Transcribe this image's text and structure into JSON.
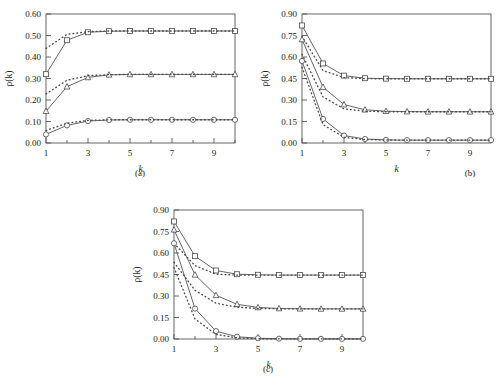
{
  "figure": {
    "panels": [
      {
        "id": "a",
        "caption": "(a)"
      },
      {
        "id": "b",
        "caption": "(b)"
      },
      {
        "id": "c",
        "caption": "(c)"
      }
    ]
  },
  "labels": {
    "xaxis": "k",
    "yaxis": "ρ(k)",
    "caption_a": "(a)",
    "caption_b": "(b)",
    "caption_c": "(c)"
  },
  "chart_data": [
    {
      "type": "line",
      "panel": "(a)",
      "title": "",
      "xlabel": "k",
      "ylabel": "ρ(k)",
      "xlim": [
        1,
        10
      ],
      "ylim": [
        0.0,
        0.6
      ],
      "xticks": [
        1,
        3,
        5,
        7,
        9
      ],
      "xticklabels": [
        "1",
        "3",
        "5",
        "7",
        "9"
      ],
      "yticks": [
        0.0,
        0.1,
        0.2,
        0.3,
        0.4,
        0.5,
        0.6
      ],
      "yticklabels": [
        "0.00",
        "0.10",
        "0.20",
        "0.30",
        "0.40",
        "0.50",
        "0.60"
      ],
      "grid": false,
      "legend": "none",
      "x": [
        1,
        2,
        3,
        4,
        5,
        6,
        7,
        8,
        9,
        10
      ],
      "series": [
        {
          "name": "square-solid",
          "marker": "square",
          "linestyle": "solid",
          "values": [
            0.32,
            0.478,
            0.515,
            0.52,
            0.521,
            0.521,
            0.521,
            0.521,
            0.521,
            0.521
          ]
        },
        {
          "name": "square-dotted",
          "marker": "none",
          "linestyle": "dotted",
          "values": [
            0.44,
            0.505,
            0.518,
            0.521,
            0.521,
            0.521,
            0.521,
            0.521,
            0.521,
            0.521
          ]
        },
        {
          "name": "triangle-solid",
          "marker": "triangle",
          "linestyle": "solid",
          "values": [
            0.148,
            0.262,
            0.305,
            0.317,
            0.319,
            0.319,
            0.319,
            0.319,
            0.319,
            0.319
          ]
        },
        {
          "name": "triangle-dotted",
          "marker": "none",
          "linestyle": "dotted",
          "values": [
            0.228,
            0.292,
            0.313,
            0.318,
            0.319,
            0.319,
            0.319,
            0.319,
            0.319,
            0.319
          ]
        },
        {
          "name": "circle-solid",
          "marker": "circle",
          "linestyle": "solid",
          "values": [
            0.04,
            0.082,
            0.102,
            0.107,
            0.108,
            0.108,
            0.108,
            0.108,
            0.108,
            0.108
          ]
        },
        {
          "name": "circle-dotted",
          "marker": "none",
          "linestyle": "dotted",
          "values": [
            0.058,
            0.092,
            0.105,
            0.108,
            0.108,
            0.108,
            0.108,
            0.108,
            0.108,
            0.108
          ]
        }
      ]
    },
    {
      "type": "line",
      "panel": "(b)",
      "title": "",
      "xlabel": "k",
      "ylabel": "ρ(k)",
      "xlim": [
        1,
        10
      ],
      "ylim": [
        0.0,
        0.9
      ],
      "xticks": [
        1,
        3,
        5,
        7,
        9
      ],
      "xticklabels": [
        "1",
        "3",
        "5",
        "7",
        "9"
      ],
      "yticks": [
        0.0,
        0.15,
        0.3,
        0.45,
        0.6,
        0.75,
        0.9
      ],
      "yticklabels": [
        "0.00",
        "0.15",
        "0.30",
        "0.45",
        "0.60",
        "0.75",
        "0.90"
      ],
      "grid": false,
      "legend": "none",
      "x": [
        1,
        2,
        3,
        4,
        5,
        6,
        7,
        8,
        9,
        10
      ],
      "series": [
        {
          "name": "square-solid",
          "marker": "square",
          "linestyle": "solid",
          "values": [
            0.82,
            0.555,
            0.47,
            0.452,
            0.449,
            0.448,
            0.448,
            0.448,
            0.448,
            0.448
          ]
        },
        {
          "name": "square-dotted",
          "marker": "none",
          "linestyle": "dotted",
          "values": [
            0.745,
            0.505,
            0.456,
            0.449,
            0.448,
            0.448,
            0.448,
            0.448,
            0.448,
            0.448
          ]
        },
        {
          "name": "triangle-solid",
          "marker": "triangle",
          "linestyle": "solid",
          "values": [
            0.722,
            0.39,
            0.268,
            0.232,
            0.222,
            0.219,
            0.218,
            0.218,
            0.218,
            0.218
          ]
        },
        {
          "name": "triangle-dotted",
          "marker": "none",
          "linestyle": "dotted",
          "values": [
            0.618,
            0.322,
            0.238,
            0.222,
            0.218,
            0.218,
            0.218,
            0.218,
            0.218,
            0.218
          ]
        },
        {
          "name": "circle-solid",
          "marker": "circle",
          "linestyle": "solid",
          "values": [
            0.572,
            0.168,
            0.052,
            0.028,
            0.022,
            0.02,
            0.02,
            0.02,
            0.02,
            0.02
          ]
        },
        {
          "name": "circle-dotted",
          "marker": "none",
          "linestyle": "dotted",
          "values": [
            0.528,
            0.128,
            0.04,
            0.024,
            0.021,
            0.02,
            0.02,
            0.02,
            0.02,
            0.02
          ]
        }
      ]
    },
    {
      "type": "line",
      "panel": "(c)",
      "title": "",
      "xlabel": "k",
      "ylabel": "ρ(k)",
      "xlim": [
        1,
        10
      ],
      "ylim": [
        0.0,
        0.9
      ],
      "xticks": [
        1,
        3,
        5,
        7,
        9
      ],
      "xticklabels": [
        "1",
        "3",
        "5",
        "7",
        "9"
      ],
      "yticks": [
        0.0,
        0.15,
        0.3,
        0.45,
        0.6,
        0.75,
        0.9
      ],
      "yticklabels": [
        "0.00",
        "0.15",
        "0.30",
        "0.45",
        "0.60",
        "0.75",
        "0.90"
      ],
      "grid": false,
      "legend": "none",
      "x": [
        1,
        2,
        3,
        4,
        5,
        6,
        7,
        8,
        9,
        10
      ],
      "series": [
        {
          "name": "square-solid",
          "marker": "square",
          "linestyle": "solid",
          "values": [
            0.82,
            0.578,
            0.478,
            0.452,
            0.448,
            0.446,
            0.446,
            0.446,
            0.446,
            0.446
          ]
        },
        {
          "name": "square-dotted",
          "marker": "none",
          "linestyle": "dotted",
          "values": [
            0.668,
            0.512,
            0.452,
            0.446,
            0.446,
            0.446,
            0.446,
            0.446,
            0.446,
            0.446
          ]
        },
        {
          "name": "triangle-solid",
          "marker": "triangle",
          "linestyle": "solid",
          "values": [
            0.762,
            0.448,
            0.305,
            0.242,
            0.22,
            0.213,
            0.211,
            0.21,
            0.21,
            0.21
          ]
        },
        {
          "name": "triangle-dotted",
          "marker": "none",
          "linestyle": "dotted",
          "values": [
            0.535,
            0.34,
            0.25,
            0.222,
            0.213,
            0.211,
            0.21,
            0.21,
            0.21,
            0.21
          ]
        },
        {
          "name": "circle-solid",
          "marker": "circle",
          "linestyle": "solid",
          "values": [
            0.668,
            0.212,
            0.055,
            0.016,
            0.005,
            0.002,
            0.001,
            0.001,
            0.001,
            0.001
          ]
        },
        {
          "name": "circle-dotted",
          "marker": "none",
          "linestyle": "dotted",
          "values": [
            0.498,
            0.14,
            0.032,
            0.008,
            0.002,
            0.001,
            0.001,
            0.001,
            0.001,
            0.001
          ]
        }
      ]
    }
  ],
  "style": {
    "line_color": "#4a4a4a",
    "axis_color": "#555555",
    "text_color": "#1a1a1a",
    "marker_fill": "#ffffff"
  }
}
